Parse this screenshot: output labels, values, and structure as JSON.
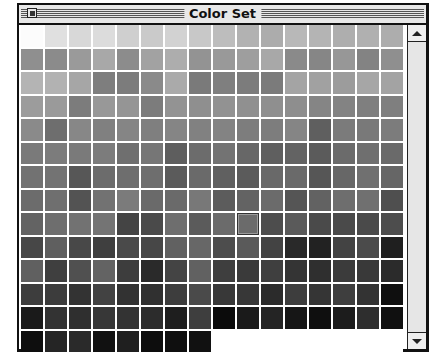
{
  "window": {
    "title": "Color Set",
    "close_box": "close-box"
  },
  "palette": {
    "columns": 16,
    "rows": 14,
    "selected_index": 137,
    "cells": [
      "#fcfcfc",
      "#e0e0e0",
      "#d8d8d8",
      "#dcdcdc",
      "#cfcfcf",
      "#cacaca",
      "#d2d2d2",
      "#c8c8c8",
      "#bdbdbd",
      "#b2b2b2",
      "#acacac",
      "#b8b8b8",
      "#b4b4b4",
      "#aeaeae",
      "#b0b0b0",
      "#adadad",
      "#8f8f8f",
      "#8b8b8b",
      "#9a9a9a",
      "#a8a8a8",
      "#8c8c8c",
      "#a2a2a2",
      "#adadad",
      "#939393",
      "#999999",
      "#9e9e9e",
      "#a8a8a8",
      "#8a8a8a",
      "#868686",
      "#979797",
      "#838383",
      "#8f8f8f",
      "#b4b4b4",
      "#b2b2b2",
      "#a6a6a6",
      "#7e7e7e",
      "#7c7c7c",
      "#8a8a8a",
      "#aaaaaa",
      "#7a7a7a",
      "#7f7f7f",
      "#7c7c7c",
      "#7b7b7b",
      "#a4a4a4",
      "#a1a1a1",
      "#9c9c9c",
      "#a6a6a6",
      "#a3a3a3",
      "#9c9c9c",
      "#9a9a9a",
      "#7c7c7c",
      "#989898",
      "#959595",
      "#7c7c7c",
      "#939393",
      "#8f8f8f",
      "#929292",
      "#909090",
      "#8f8f8f",
      "#8e8e8e",
      "#858585",
      "#838383",
      "#7f7f7f",
      "#7f7f7f",
      "#8a8a8a",
      "#6e6e6e",
      "#878787",
      "#808080",
      "#858585",
      "#7f7f7f",
      "#858585",
      "#818181",
      "#838383",
      "#7d7d7d",
      "#7d7d7d",
      "#858585",
      "#5f5f5f",
      "#7b7b7b",
      "#797979",
      "#7c7c7c",
      "#7a7a7a",
      "#7c7c7c",
      "#7a7a7a",
      "#7c7c7c",
      "#6f6f6f",
      "#767676",
      "#5e5e5e",
      "#6c6c6c",
      "#737373",
      "#676767",
      "#5f5f5f",
      "#636363",
      "#5b5b5b",
      "#6b6b6b",
      "#6f6f6f",
      "#6a6a6a",
      "#727272",
      "#737373",
      "#575757",
      "#6c6c6c",
      "#6e6e6e",
      "#6e6e6e",
      "#5b5b5b",
      "#6a6a6a",
      "#606060",
      "#5b5b5b",
      "#696969",
      "#6a6a6a",
      "#565656",
      "#676767",
      "#707070",
      "#666666",
      "#6c6c6c",
      "#6f6f6f",
      "#535353",
      "#727272",
      "#7b7b7b",
      "#6a6a6a",
      "#6a6a6a",
      "#787878",
      "#5c5c5c",
      "#636363",
      "#6b6b6b",
      "#555555",
      "#626262",
      "#6e6e6e",
      "#707070",
      "#4f4f4f",
      "#636363",
      "#6e6e6e",
      "#727272",
      "#747474",
      "#444444",
      "#4a4a4a",
      "#6e6e6e",
      "#5b5b5b",
      "#6b6b6b",
      "#6b6b6b",
      "#4d4d4d",
      "#5a5a5a",
      "#4a4a4a",
      "#4a4a4a",
      "#4a4a4a",
      "#4d4d4d",
      "#474747",
      "#5f5f5f",
      "#484848",
      "#3f3f3f",
      "#4a4a4a",
      "#474747",
      "#616161",
      "#676767",
      "#4d4d4d",
      "#5a5a5a",
      "#434343",
      "#292929",
      "#222222",
      "#434343",
      "#4b4b4b",
      "#1f1f1f",
      "#606060",
      "#3f3f3f",
      "#505050",
      "#636363",
      "#3d3d3d",
      "#2a2a2a",
      "#444444",
      "#616161",
      "#3e3e3e",
      "#3a3a3a",
      "#3f3f3f",
      "#343434",
      "#2f2f2f",
      "#3b3b3b",
      "#393939",
      "#2b2b2b",
      "#3d3d3d",
      "#3c3c3c",
      "#333333",
      "#424242",
      "#323232",
      "#303030",
      "#3d3d3d",
      "#4a4a4a",
      "#383838",
      "#373737",
      "#2b2b2b",
      "#3d3d3d",
      "#353535",
      "#3e3e3e",
      "#333333",
      "#0f0f0f",
      "#1a1a1a",
      "#333333",
      "#2f2f2f",
      "#373737",
      "#333333",
      "#2c2c2c",
      "#1e1e1e",
      "#3e3e3e",
      "#0b0b0b",
      "#1a1a1a",
      "#242424",
      "#161616",
      "#0f0f0f",
      "#1c1c1c",
      "#2e2e2e",
      "#101010",
      "#0e0e0e",
      "#252525",
      "#2a2a2a",
      "#111111",
      "#1f1f1f",
      "#0d0d0d",
      "#0f0f0f",
      "#111111"
    ]
  },
  "scrollbar": {
    "up_arrow": "scroll-up",
    "down_arrow": "scroll-down"
  }
}
